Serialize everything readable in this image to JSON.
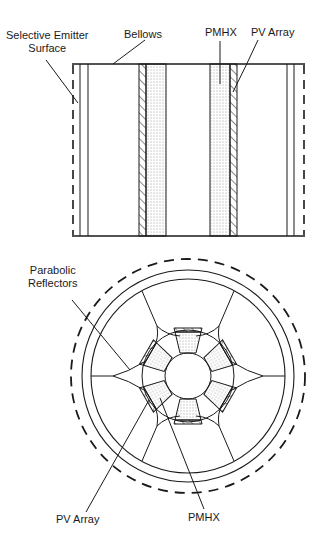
{
  "figure": {
    "side_view": {
      "labels": {
        "selective_emitter": [
          "Selective Emitter",
          "Surface"
        ],
        "bellows": "Bellows",
        "pmhx": "PMHX",
        "pv_array": "PV Array"
      }
    },
    "end_view": {
      "labels": {
        "parabolic_reflectors": [
          "Parabolic",
          "Reflectors"
        ],
        "pv_array": "PV Array",
        "pmhx": "PMHX"
      },
      "segment_count": 6
    },
    "colors": {
      "line": "#1a1a1a",
      "background": "#ffffff"
    }
  }
}
